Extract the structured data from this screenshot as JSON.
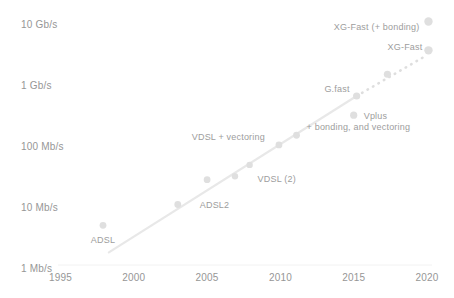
{
  "page": {
    "background": "#ffffff",
    "title": ""
  },
  "chart_data": {
    "type": "scatter",
    "title": "",
    "subtitle": "",
    "legend": "none",
    "grid": "off",
    "x_axis": {
      "label": "",
      "ticks": [
        1995,
        2000,
        2005,
        2010,
        2015,
        2020
      ],
      "range": [
        1995,
        2020
      ]
    },
    "y_axis": {
      "label": "",
      "unit": "Mb/s",
      "scale": "log",
      "range_mbps": [
        1,
        10000
      ],
      "ticks": [
        {
          "label": "10 Gb/s",
          "mbps": 10000
        },
        {
          "label": "1 Gb/s",
          "mbps": 1000
        },
        {
          "label": "100 Mb/s",
          "mbps": 100
        },
        {
          "label": "10 Mb/s",
          "mbps": 10
        },
        {
          "label": "1 Mb/s",
          "mbps": 1
        }
      ]
    },
    "points": [
      {
        "name": "adsl",
        "label": "ADSL",
        "year": 1997.9,
        "mbps": 5,
        "r": 3.4,
        "label_pos": {
          "anchor": "middle",
          "dx": 0,
          "dy": 18
        }
      },
      {
        "name": "adsl2",
        "label": "ADSL2",
        "year": 2003.0,
        "mbps": 11,
        "r": 3.4,
        "label_pos": {
          "anchor": "start",
          "dx": 22,
          "dy": 4
        }
      },
      {
        "name": "adsl2plus",
        "label": "",
        "year": 2005.0,
        "mbps": 28,
        "r": 3.4,
        "label_pos": null
      },
      {
        "name": "vdsl",
        "label": "",
        "year": 2006.9,
        "mbps": 32,
        "r": 3.2,
        "label_pos": null
      },
      {
        "name": "vdsl2",
        "label": "VDSL (2)",
        "year": 2007.9,
        "mbps": 49,
        "r": 3.2,
        "label_pos": {
          "anchor": "start",
          "dx": 8,
          "dy": 17
        }
      },
      {
        "name": "vdsl-vectoring",
        "label": "VDSL + vectoring",
        "year": 2009.9,
        "mbps": 104,
        "r": 3.4,
        "label_pos": {
          "anchor": "end",
          "dx": -14,
          "dy": -5
        }
      },
      {
        "name": "bonding-vectoring",
        "label": "+ bonding, and vectoring",
        "year": 2011.1,
        "mbps": 150,
        "r": 3.4,
        "label_pos": {
          "anchor": "start",
          "dx": 10,
          "dy": -5
        }
      },
      {
        "name": "vplus",
        "label": "Vplus",
        "year": 2015.0,
        "mbps": 320,
        "r": 3.6,
        "label_pos": {
          "anchor": "start",
          "dx": 10,
          "dy": 4
        }
      },
      {
        "name": "gfast",
        "label": "G.fast",
        "year": 2015.2,
        "mbps": 660,
        "r": 3.6,
        "label_pos": {
          "anchor": "end",
          "dx": -7,
          "dy": -4
        }
      },
      {
        "name": "projection-2017",
        "label": "",
        "year": 2017.3,
        "mbps": 1500,
        "r": 3.6,
        "label_pos": null
      },
      {
        "name": "xgfast",
        "label": "XG-Fast",
        "year": 2020.1,
        "mbps": 3700,
        "r": 4.2,
        "label_pos": {
          "anchor": "end",
          "dx": -6,
          "dy": 0
        }
      },
      {
        "name": "xgfast-bonding",
        "label": "XG-Fast (+ bonding)",
        "year": 2020.1,
        "mbps": 11000,
        "r": 4.2,
        "label_pos": {
          "anchor": "end",
          "dx": -9,
          "dy": 9
        }
      }
    ],
    "trendline": {
      "solid": {
        "from": {
          "year": 1998.3,
          "mbps": 1.8
        },
        "to": {
          "year": 2015.2,
          "mbps": 660
        }
      },
      "dashed": {
        "from": {
          "year": 2015.2,
          "mbps": 660
        },
        "to": {
          "year": 2019.8,
          "mbps": 2900
        }
      }
    },
    "colors": {
      "background": "#ffffff",
      "dot": "#dfdfdf",
      "line": "#e8e8e8",
      "dash": "#dedede",
      "axis_text": "#969696",
      "label_text": "#9d9d9d",
      "baseline": "#f2f2f2"
    },
    "layout": {
      "width": 454,
      "height": 298,
      "x0": 60.5,
      "year0": 1995,
      "px_per_year": 14.66,
      "y0": 268,
      "px_per_decade": 61,
      "x_tick_baseline": 281,
      "axis_line": {
        "x1": 58,
        "x2": 432,
        "y": 265
      },
      "axis_font_size": 10,
      "label_font_size": 9
    }
  }
}
